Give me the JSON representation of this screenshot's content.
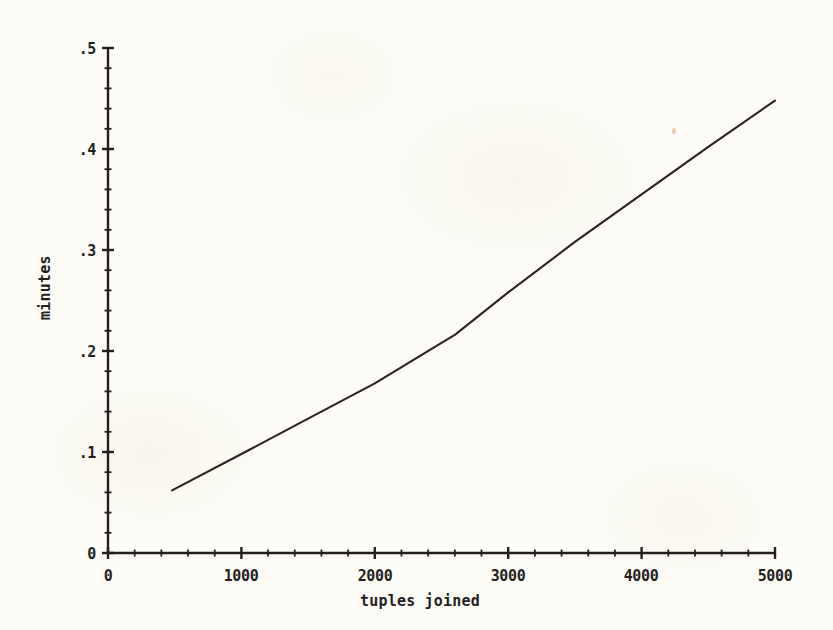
{
  "figure": {
    "background_color": "#fdfcf6",
    "ink_color": "#241f1c",
    "line_color": "#2b2420"
  },
  "axes": {
    "x_label": "tuples joined",
    "y_label": "minutes",
    "x_ticks": [
      "0",
      "1000",
      "2000",
      "3000",
      "4000",
      "5000"
    ],
    "y_ticks": [
      "0",
      ".1",
      ".2",
      ".3",
      ".4",
      ".5"
    ],
    "y_origin_label": "0"
  },
  "chart_data": {
    "type": "line",
    "title": "",
    "xlabel": "tuples joined",
    "ylabel": "minutes",
    "xlim": [
      0,
      5000
    ],
    "ylim": [
      0,
      0.5
    ],
    "xticks": [
      0,
      1000,
      2000,
      3000,
      4000,
      5000
    ],
    "yticks": [
      0,
      0.1,
      0.2,
      0.3,
      0.4,
      0.5
    ],
    "xtick_labels": [
      "0",
      "1000",
      "2000",
      "3000",
      "4000",
      "5000"
    ],
    "ytick_labels": [
      "0",
      ".1",
      ".2",
      ".3",
      ".4",
      ".5"
    ],
    "minor_ticks": true,
    "grid": false,
    "legend": null,
    "series": [
      {
        "name": "join time",
        "x": [
          480,
          1000,
          1500,
          2000,
          2500,
          2600,
          3000,
          3500,
          4000,
          4500,
          5000
        ],
        "y": [
          0.062,
          0.098,
          0.133,
          0.168,
          0.208,
          0.216,
          0.258,
          0.308,
          0.355,
          0.402,
          0.448
        ]
      }
    ]
  }
}
